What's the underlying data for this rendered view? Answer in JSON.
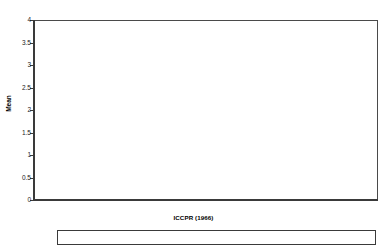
{
  "chart_data": {
    "type": "bar",
    "title": "",
    "xlabel": "ICCPR (1966)",
    "ylabel": "Mean",
    "ylim": [
      0,
      4
    ],
    "ytick_step": 0.5,
    "grid": false,
    "legend_position": "bottom",
    "categories": [
      "No signature",
      "Ratification"
    ],
    "series": [
      {
        "name": "PTS (AI)",
        "values": [
          2.62,
          2.53
        ],
        "pattern": "light-dotted",
        "color": "#f7f7f7"
      },
      {
        "name": "PTS (SD)",
        "values": [
          2.35,
          2.31
        ],
        "pattern": "dark-dotted",
        "color": "#1c1c1c"
      },
      {
        "name": "FHCR15",
        "values": [
          3.31,
          2.73
        ],
        "pattern": "diagonal-hatch",
        "color": "#ffffff"
      },
      {
        "name": "FHPR15",
        "values": [
          3.37,
          2.65
        ],
        "pattern": "solid-grey",
        "color": "#b8b8b8"
      },
      {
        "name": "Torture Scale (Hathaway)",
        "values": [
          2.77,
          2.7
        ],
        "pattern": "solid-black",
        "color": "#252525"
      }
    ],
    "ytick_labels": [
      "0",
      "0.5",
      "1",
      "1.5",
      "2",
      "2.5",
      "3",
      "3.5",
      "4"
    ]
  },
  "axis": {
    "y_title": "Mean",
    "x_title": "ICCPR (1966)",
    "yticks": [
      {
        "value": 4,
        "label": "4"
      },
      {
        "value": 3.5,
        "label": "3.5"
      },
      {
        "value": 3,
        "label": "3"
      },
      {
        "value": 2.5,
        "label": "2.5"
      },
      {
        "value": 2,
        "label": "2"
      },
      {
        "value": 1.5,
        "label": "1.5"
      },
      {
        "value": 1,
        "label": "1"
      },
      {
        "value": 0.5,
        "label": "0.5"
      },
      {
        "value": 0,
        "label": "0"
      }
    ]
  },
  "categories": [
    {
      "label": "No signature"
    },
    {
      "label": "Ratification"
    }
  ],
  "legend": {
    "items": [
      {
        "label": "PTS (AI)"
      },
      {
        "label": "PTS (SD)"
      },
      {
        "label": "FHCR15"
      },
      {
        "label": "FHPR15"
      },
      {
        "label": "Torture Scale (Hathaway)"
      }
    ]
  }
}
